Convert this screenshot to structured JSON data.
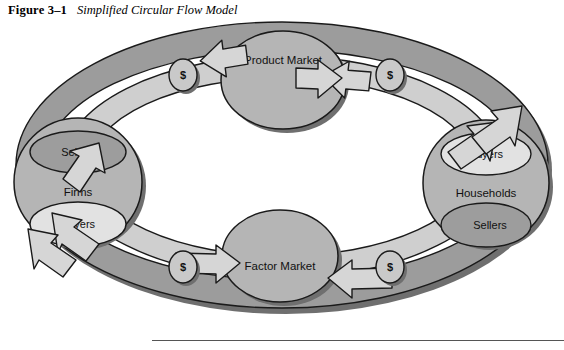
{
  "figure": {
    "number": "Figure 3–1",
    "title": "Simplified Circular Flow Model"
  },
  "diagram": {
    "type": "circular-flow",
    "nodes": [
      {
        "id": "product-market",
        "label": "Product Market",
        "position": "top"
      },
      {
        "id": "factor-market",
        "label": "Factor Market",
        "position": "bottom"
      },
      {
        "id": "firms",
        "label": "Firms",
        "position": "left"
      },
      {
        "id": "households",
        "label": "Households",
        "position": "right"
      }
    ],
    "roles": [
      {
        "id": "firms-sellers",
        "label": "Sellers",
        "parent": "firms",
        "position": "upper"
      },
      {
        "id": "firms-buyers",
        "label": "Buyers",
        "parent": "firms",
        "position": "lower"
      },
      {
        "id": "households-buyers",
        "label": "Buyers",
        "parent": "households",
        "position": "upper"
      },
      {
        "id": "households-sellers",
        "label": "Sellers",
        "parent": "households",
        "position": "lower"
      }
    ],
    "money_markers": [
      {
        "id": "money-top-left",
        "label": "$",
        "position": "top-left"
      },
      {
        "id": "money-top-right",
        "label": "$",
        "position": "top-right"
      },
      {
        "id": "money-bottom-left",
        "label": "$",
        "position": "bottom-left"
      },
      {
        "id": "money-bottom-right",
        "label": "$",
        "position": "bottom-right"
      }
    ],
    "flows": [
      {
        "id": "flow-outer",
        "from": "firms-sellers",
        "to": "product-market",
        "direction": "clockwise"
      },
      {
        "id": "flow-inner",
        "from": "households-buyers",
        "to": "product-market",
        "direction": "counter-clockwise"
      },
      {
        "id": "flow-outer-bottom",
        "from": "households-sellers",
        "to": "factor-market",
        "direction": "clockwise"
      },
      {
        "id": "flow-inner-bottom",
        "from": "firms-buyers",
        "to": "factor-market",
        "direction": "counter-clockwise"
      }
    ],
    "colors": {
      "band_outer": "#9c9c9c",
      "band_inner": "#cfcfcf",
      "node_fill": "#b5b5b5",
      "role_dark": "#9d9d9d",
      "role_light": "#e2e2e2",
      "money_fill": "#c9c9c9",
      "arrow_fill": "#d6d6d6",
      "shadow": "#6f6f6f",
      "outline": "#1a1a1a"
    }
  }
}
